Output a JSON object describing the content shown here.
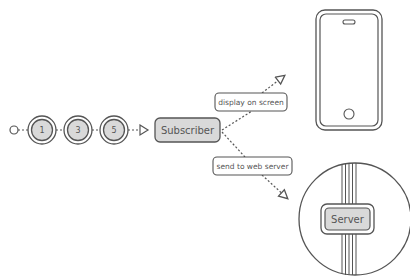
{
  "diagram": {
    "type": "reactive-stream-flow",
    "colors": {
      "stroke": "#555555",
      "node_fill": "#d9d9d9",
      "background": "#ffffff"
    },
    "stream": {
      "start_marker": "start-circle",
      "items": [
        {
          "value": "1"
        },
        {
          "value": "3"
        },
        {
          "value": "5"
        }
      ],
      "end_marker": "open-triangle-arrow"
    },
    "subscriber": {
      "label": "Subscriber"
    },
    "edges": [
      {
        "label": "display  on screen",
        "target": "phone"
      },
      {
        "label": "send to web server",
        "target": "server"
      }
    ],
    "phone": {
      "icon": "smartphone-icon"
    },
    "server": {
      "label": "Server",
      "icon": "server-globe-icon"
    }
  }
}
